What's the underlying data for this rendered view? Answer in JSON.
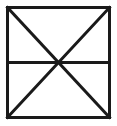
{
  "figure": {
    "name": "square-with-diagonals-and-horizontal-midline",
    "canvas": {
      "width": 117,
      "height": 126,
      "background_color": "#ffffff"
    },
    "style": {
      "stroke_color": "#1a1a1a",
      "stroke_width": 3,
      "fill_color": "none",
      "line_cap": "square",
      "line_join": "miter"
    },
    "square": {
      "name": "outer-square",
      "left": 7.5,
      "top": 7.5,
      "right": 109.5,
      "bottom": 117.5,
      "width": 102,
      "height": 110
    },
    "vertices": {
      "top_left": {
        "label": "A",
        "x": 7.5,
        "y": 7.5
      },
      "top_right": {
        "label": "B",
        "x": 109.5,
        "y": 7.5
      },
      "bottom_right": {
        "label": "C",
        "x": 109.5,
        "y": 117.5
      },
      "bottom_left": {
        "label": "D",
        "x": 7.5,
        "y": 117.5
      },
      "center": {
        "label": "O",
        "x": 58.5,
        "y": 62.5
      },
      "mid_left": {
        "label": "M",
        "x": 7.5,
        "y": 62.5
      },
      "mid_right": {
        "label": "N",
        "x": 109.5,
        "y": 62.5
      }
    },
    "lines": [
      {
        "name": "square-top-edge",
        "x1": 7.5,
        "y1": 7.5,
        "x2": 109.5,
        "y2": 7.5
      },
      {
        "name": "square-right-edge",
        "x1": 109.5,
        "y1": 7.5,
        "x2": 109.5,
        "y2": 117.5
      },
      {
        "name": "square-bottom-edge",
        "x1": 109.5,
        "y1": 117.5,
        "x2": 7.5,
        "y2": 117.5
      },
      {
        "name": "square-left-edge",
        "x1": 7.5,
        "y1": 117.5,
        "x2": 7.5,
        "y2": 7.5
      },
      {
        "name": "diagonal-top-left-to-bottom-right",
        "x1": 7.5,
        "y1": 7.5,
        "x2": 109.5,
        "y2": 117.5
      },
      {
        "name": "diagonal-top-right-to-bottom-left",
        "x1": 109.5,
        "y1": 7.5,
        "x2": 7.5,
        "y2": 117.5
      },
      {
        "name": "horizontal-midline",
        "x1": 7.5,
        "y1": 62.5,
        "x2": 109.5,
        "y2": 62.5
      }
    ],
    "regions_count": 6,
    "regions": [
      {
        "name": "region-top-triangle",
        "vertices": "A-B-O"
      },
      {
        "name": "region-left-upper-triangle",
        "vertices": "A-M-O"
      },
      {
        "name": "region-right-upper-triangle",
        "vertices": "B-N-O"
      },
      {
        "name": "region-left-lower-triangle",
        "vertices": "M-D-O"
      },
      {
        "name": "region-right-lower-triangle",
        "vertices": "N-C-O"
      },
      {
        "name": "region-bottom-triangle",
        "vertices": "D-C-O"
      }
    ]
  }
}
